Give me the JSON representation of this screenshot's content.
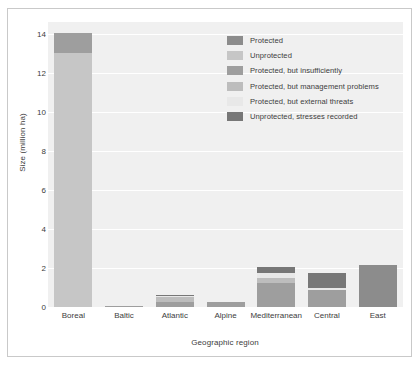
{
  "figure": {
    "background": "#ffffff",
    "plot_background": "#f0f0f0",
    "gridline_color": "#ffffff",
    "frame_color": "#c9c9c9",
    "text_color": "#3d3d3d"
  },
  "chart_data": {
    "type": "bar",
    "subtype": "stacked",
    "title": "",
    "xlabel": "Geographic region",
    "ylabel": "Size (million ha)",
    "categories": [
      "Boreal",
      "Baltic",
      "Atlantic",
      "Alpine",
      "Mediterranean",
      "Central",
      "East"
    ],
    "ylim": [
      0,
      14.6
    ],
    "yticks": [
      0,
      2,
      4,
      6,
      8,
      10,
      12,
      14
    ],
    "ytick_labels": [
      "0",
      "2",
      "4",
      "6",
      "8",
      "10",
      "12",
      "14"
    ],
    "grid": true,
    "grid_axis": "y",
    "legend_position": "upper center",
    "series": [
      {
        "name": "Protected",
        "color": "#8c8c8c",
        "values": [
          0.0,
          0.0,
          0.0,
          0.0,
          0.0,
          0.0,
          2.15
        ]
      },
      {
        "name": "Unprotected",
        "color": "#c6c6c6",
        "values": [
          13.0,
          0.0,
          0.0,
          0.0,
          0.0,
          0.0,
          0.0
        ]
      },
      {
        "name": "Protected, but insufficiently",
        "color": "#9e9e9e",
        "values": [
          1.05,
          0.05,
          0.28,
          0.24,
          1.25,
          0.85,
          0.0
        ]
      },
      {
        "name": "Protected, but management problems",
        "color": "#bdbdbd",
        "values": [
          0.0,
          0.0,
          0.22,
          0.0,
          0.25,
          0.0,
          0.0
        ]
      },
      {
        "name": "Protected, but external threats",
        "color": "#e8e8e8",
        "values": [
          0.0,
          0.0,
          0.09,
          0.0,
          0.22,
          0.12,
          0.0
        ]
      },
      {
        "name": "Unprotected, stresses recorded",
        "color": "#777777",
        "values": [
          0.0,
          0.0,
          0.04,
          0.0,
          0.33,
          0.78,
          0.0
        ]
      }
    ],
    "totals": [
      14.05,
      0.05,
      0.63,
      0.24,
      2.05,
      1.75,
      2.15
    ]
  },
  "legend": {
    "items": [
      {
        "label": "Protected",
        "color": "#8c8c8c"
      },
      {
        "label": "Unprotected",
        "color": "#c6c6c6"
      },
      {
        "label": "Protected, but insufficiently",
        "color": "#9e9e9e"
      },
      {
        "label": "Protected, but management problems",
        "color": "#bdbdbd"
      },
      {
        "label": "Protected, but external threats",
        "color": "#e8e8e8"
      },
      {
        "label": "Unprotected, stresses recorded",
        "color": "#777777"
      }
    ]
  }
}
